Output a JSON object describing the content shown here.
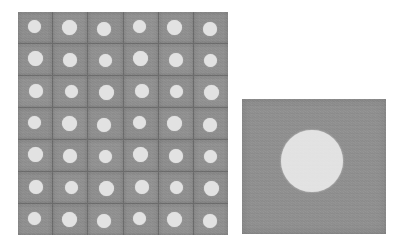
{
  "figure": {
    "background_color": "#ffffff",
    "width": 404,
    "height": 250,
    "caption": "",
    "title": ""
  },
  "palette": {
    "substrate_gray": "#8e8e8e",
    "substrate_gray_dark": "#868686",
    "grid_line_gray": "#6a6a6a",
    "feature_light": "#e2e2e2",
    "feature_light_edge": "#d2d2d2",
    "background_white": "#ffffff"
  },
  "panels": [
    {
      "name": "array-overview",
      "label": "",
      "x": 18,
      "y": 12,
      "width": 210,
      "height": 223,
      "columns": 6,
      "rows": 7,
      "cell_count": 42,
      "cell_width": 35,
      "cell_height": 31.86,
      "dot_diameter": 14,
      "grid_line_width": 1,
      "substrate_color": "#8e8e8e",
      "grid_line_color": "#6a6a6a",
      "dot_color": "#e2e2e2"
    },
    {
      "name": "feature-detail",
      "label": "",
      "x": 242,
      "y": 99,
      "width": 144,
      "height": 135,
      "substrate_color": "#8e8e8e",
      "dot_color": "#e2e2e2",
      "dot_diameter": 62,
      "dot_center_x": 70,
      "dot_center_y": 62
    }
  ],
  "chart_data": {
    "type": "heatmap",
    "title": "",
    "xlabel": "",
    "ylabel": "",
    "panel_count": 2,
    "array": {
      "columns": 6,
      "rows": 7,
      "total_features": 42,
      "cell_pitch_x_px": 35,
      "cell_pitch_y_px": 32,
      "feature_diameter_px": 14,
      "feature_fill_fraction": 0.15,
      "uniform": true,
      "values": [
        [
          1,
          1,
          1,
          1,
          1,
          1
        ],
        [
          1,
          1,
          1,
          1,
          1,
          1
        ],
        [
          1,
          1,
          1,
          1,
          1,
          1
        ],
        [
          1,
          1,
          1,
          1,
          1,
          1
        ],
        [
          1,
          1,
          1,
          1,
          1,
          1
        ],
        [
          1,
          1,
          1,
          1,
          1,
          1
        ],
        [
          1,
          1,
          1,
          1,
          1,
          1
        ]
      ]
    },
    "detail": {
      "magnified_features": 1,
      "feature_diameter_px": 62,
      "panel_width_px": 144,
      "panel_height_px": 135,
      "feature_fill_fraction": 0.155
    },
    "legend": [],
    "annotations": [],
    "grid": true
  }
}
